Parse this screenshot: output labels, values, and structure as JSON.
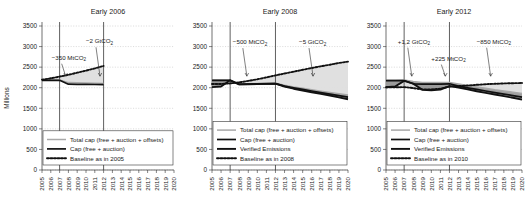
{
  "figure": {
    "ylabel": "Millions",
    "panel_count": 3
  },
  "chart_data": {
    "type": "line",
    "title": "",
    "xlabel": "",
    "ylabel": "Millions",
    "ylim": [
      0,
      3500
    ],
    "yticks": [
      0,
      500,
      1000,
      1500,
      2000,
      2500,
      3000,
      3500
    ],
    "xlim": [
      2005,
      2020
    ],
    "xticks": [
      2005,
      2006,
      2007,
      2008,
      2009,
      2010,
      2011,
      2012,
      2013,
      2014,
      2015,
      2016,
      2017,
      2018,
      2019,
      2020
    ],
    "grid": true,
    "legend_position": "lower-left",
    "panels": [
      {
        "title": "Early 2006",
        "legend": [
          "Total cap (free + auction + offsets)",
          "Cap (free + auction)",
          "Baseline as in 2005"
        ],
        "phase_lines": [
          2007,
          2012
        ],
        "annotations": [
          {
            "text": "−350 MtCO",
            "sub": "2",
            "x": 2006.1,
            "y": 2680
          },
          {
            "text": "−2 GtCO",
            "sub": "2",
            "x": 2010.0,
            "y": 3080
          }
        ],
        "series": [
          {
            "name": "Total cap (free + auction + offsets)",
            "x": [
              2005,
              2006,
              2007,
              2008,
              2009,
              2010,
              2011,
              2012
            ],
            "values": [
              2190,
              2190,
              2190,
              2125,
              2120,
              2115,
              2110,
              2105
            ]
          },
          {
            "name": "Cap (free + auction)",
            "x": [
              2005,
              2006,
              2007,
              2008,
              2009,
              2010,
              2011,
              2012
            ],
            "values": [
              2180,
              2180,
              2180,
              2085,
              2082,
              2080,
              2078,
              2075
            ]
          },
          {
            "name": "Baseline as in 2005",
            "x": [
              2005,
              2006,
              2007,
              2008,
              2009,
              2010,
              2011,
              2012
            ],
            "values": [
              2195,
              2230,
              2270,
              2315,
              2365,
              2415,
              2470,
              2530
            ]
          }
        ]
      },
      {
        "title": "Early 2008",
        "legend": [
          "Total cap (free + auction + offsets)",
          "Cap (free + auction)",
          "Verified Emissions",
          "Baseline as in 2008"
        ],
        "phase_lines": [
          2007,
          2012
        ],
        "annotations": [
          {
            "text": "−500 MtCO",
            "sub": "2",
            "x": 2007.3,
            "y": 3060
          },
          {
            "text": "−5 GtCO",
            "sub": "2",
            "x": 2014.6,
            "y": 3060
          }
        ],
        "series": [
          {
            "name": "Total cap (free + auction + offsets)",
            "x": [
              2005,
              2006,
              2007,
              2008,
              2009,
              2010,
              2011,
              2012,
              2013,
              2014,
              2015,
              2016,
              2017,
              2018,
              2019,
              2020
            ],
            "values": [
              2190,
              2190,
              2190,
              2090,
              2095,
              2100,
              2105,
              2110,
              2060,
              2020,
              1985,
              1950,
              1915,
              1885,
              1855,
              1825
            ]
          },
          {
            "name": "Cap (free + auction)",
            "x": [
              2005,
              2006,
              2007,
              2008,
              2009,
              2010,
              2011,
              2012,
              2013,
              2014,
              2015,
              2016,
              2017,
              2018,
              2019,
              2020
            ],
            "values": [
              2180,
              2180,
              2180,
              2080,
              2085,
              2090,
              2095,
              2100,
              2040,
              1998,
              1958,
              1920,
              1882,
              1845,
              1808,
              1772
            ]
          },
          {
            "name": "Verified Emissions",
            "x": [
              2005,
              2006,
              2007,
              2008,
              2009,
              2010,
              2011,
              2012,
              2013,
              2014,
              2015,
              2016,
              2017,
              2018,
              2019,
              2020
            ],
            "values": [
              2015,
              2030,
              2180,
              2080,
              2085,
              2090,
              2095,
              2100,
              2030,
              1975,
              1930,
              1890,
              1850,
              1810,
              1765,
              1720
            ]
          },
          {
            "name": "Baseline as in 2008",
            "x": [
              2005,
              2006,
              2007,
              2008,
              2009,
              2010,
              2011,
              2012,
              2013,
              2014,
              2015,
              2016,
              2017,
              2018,
              2019,
              2020
            ],
            "values": [
              2090,
              2090,
              2105,
              2130,
              2165,
              2205,
              2250,
              2300,
              2345,
              2390,
              2435,
              2480,
              2520,
              2560,
              2600,
              2635
            ]
          }
        ]
      },
      {
        "title": "Early 2012",
        "legend": [
          "Total cap (free + auction + offsets)",
          "Cap (free + auction)",
          "Verified Emissions",
          "Baseline as in 2010"
        ],
        "phase_lines": [
          2007,
          2012
        ],
        "annotations": [
          {
            "text": "+1,2 GtCO",
            "sub": "2",
            "x": 2006.3,
            "y": 3070
          },
          {
            "text": "+225 MtCO",
            "sub": "2",
            "x": 2010.0,
            "y": 2660
          },
          {
            "text": "−850 MtCO",
            "sub": "2",
            "x": 2015.0,
            "y": 3070
          }
        ],
        "series": [
          {
            "name": "Total cap (free + auction + offsets)",
            "x": [
              2005,
              2006,
              2007,
              2008,
              2009,
              2010,
              2011,
              2012,
              2013,
              2014,
              2015,
              2016,
              2017,
              2018,
              2019,
              2020
            ],
            "values": [
              2180,
              2180,
              2185,
              2150,
              2130,
              2125,
              2125,
              2130,
              2090,
              2055,
              2020,
              1985,
              1950,
              1920,
              1890,
              1860
            ]
          },
          {
            "name": "Cap (free + auction)",
            "x": [
              2005,
              2006,
              2007,
              2008,
              2009,
              2010,
              2011,
              2012,
              2013,
              2014,
              2015,
              2016,
              2017,
              2018,
              2019,
              2020
            ],
            "values": [
              2170,
              2170,
              2175,
              2095,
              2085,
              2085,
              2088,
              2095,
              2040,
              1998,
              1958,
              1920,
              1882,
              1845,
              1808,
              1772
            ]
          },
          {
            "name": "Verified Emissions",
            "x": [
              2005,
              2006,
              2007,
              2008,
              2009,
              2010,
              2011,
              2012,
              2013,
              2014,
              2015,
              2016,
              2017,
              2018,
              2019,
              2020
            ],
            "values": [
              2010,
              2030,
              2165,
              2100,
              1950,
              1940,
              1955,
              2040,
              2005,
              1960,
              1915,
              1875,
              1835,
              1795,
              1755,
              1710
            ]
          },
          {
            "name": "Baseline as in 2010",
            "x": [
              2005,
              2006,
              2007,
              2008,
              2009,
              2010,
              2011,
              2012,
              2013,
              2014,
              2015,
              2016,
              2017,
              2018,
              2019,
              2020
            ],
            "values": [
              2010,
              2010,
              2015,
              1990,
              1960,
              1960,
              1975,
              2030,
              2040,
              2055,
              2070,
              2085,
              2095,
              2105,
              2110,
              2115
            ]
          }
        ]
      }
    ]
  }
}
